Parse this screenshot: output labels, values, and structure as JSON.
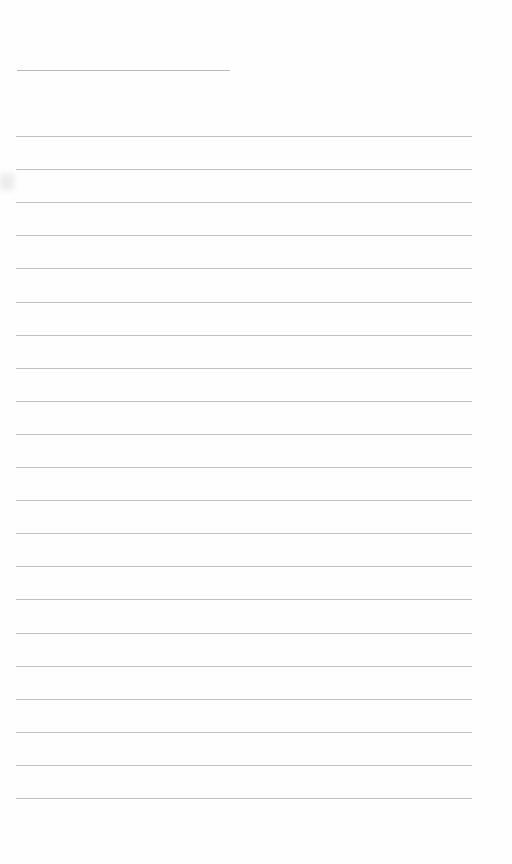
{
  "document": {
    "type": "blank ruled page",
    "title_line": {
      "x": 17,
      "y": 70,
      "width": 213
    },
    "rules": {
      "count": 21,
      "start_y": 136,
      "spacing": 33.1,
      "x": 16,
      "width": 456
    },
    "bleed_through_text": "",
    "colors": {
      "background": "#fefefe",
      "rule": "#c2c2c2"
    }
  }
}
